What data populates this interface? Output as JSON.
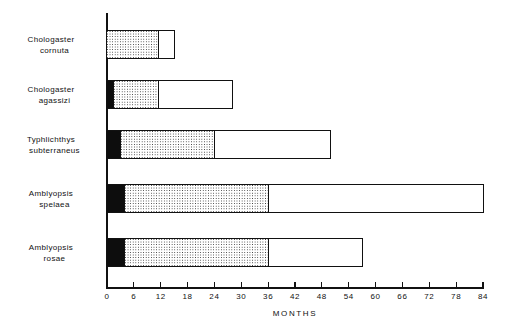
{
  "chart_data": {
    "type": "bar",
    "orientation": "horizontal",
    "title": "",
    "subtitle": "",
    "xlabel": "MONTHS",
    "ylabel": "",
    "xlim": [
      0,
      84
    ],
    "xticks": [
      0,
      6,
      12,
      18,
      24,
      30,
      36,
      42,
      48,
      54,
      60,
      66,
      72,
      78,
      84
    ],
    "xtick_labels": [
      "0",
      "6",
      "12",
      "18",
      "24",
      "30",
      "36",
      "42",
      "48",
      "54",
      "60",
      "66",
      "72",
      "78",
      "84"
    ],
    "grid": false,
    "legend": false,
    "legend_position": "none",
    "stacked": true,
    "categories": [
      "Chologaster cornuta",
      "Chologaster agassizi",
      "Typhlichthys subterraneus",
      "Amblyopsis spelaea",
      "Amblyopsis rosae"
    ],
    "category_lines": [
      [
        "Chologaster",
        "cornuta"
      ],
      [
        "Chologaster",
        "agassizi"
      ],
      [
        "Typhlichthys",
        "subterraneus"
      ],
      [
        "Amblyopsis",
        "spelaea"
      ],
      [
        "Amblyopsis",
        "rosae"
      ]
    ],
    "series": [
      {
        "name": "black-segment",
        "fill": "solid-black",
        "color": "#0d0d0d",
        "values": [
          0,
          1.5,
          3,
          4,
          4
        ]
      },
      {
        "name": "stippled-segment",
        "fill": "stipple",
        "color": "#2a2a2a",
        "values": [
          11.5,
          10,
          21,
          32,
          32
        ]
      },
      {
        "name": "open-segment",
        "fill": "white",
        "color": "#ffffff",
        "values": [
          3.5,
          16.5,
          26,
          48,
          21
        ]
      }
    ],
    "cumulative_breakpoints": [
      [
        0,
        11.5,
        15
      ],
      [
        1.5,
        11.5,
        28
      ],
      [
        3,
        24,
        50
      ],
      [
        4,
        36,
        84
      ],
      [
        4,
        36,
        57
      ]
    ],
    "totals": [
      15,
      28,
      50,
      84,
      57
    ]
  },
  "axis": {
    "x_title": "MONTHS"
  }
}
